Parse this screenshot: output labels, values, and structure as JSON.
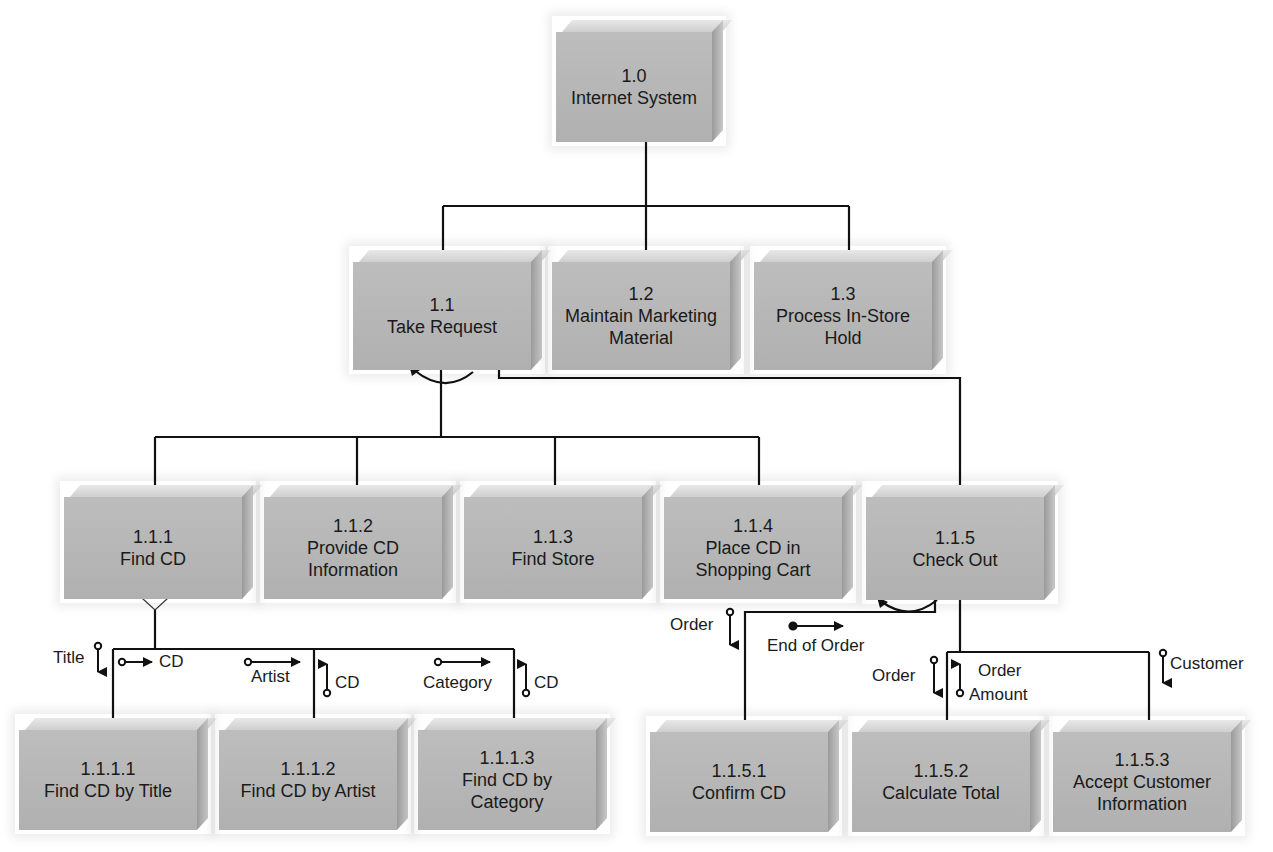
{
  "diagram": {
    "type": "structure-chart",
    "nodes": [
      {
        "id": "1.0",
        "number": "1.0",
        "lines": [
          "Internet System"
        ]
      },
      {
        "id": "1.1",
        "number": "1.1",
        "lines": [
          "Take Request"
        ]
      },
      {
        "id": "1.2",
        "number": "1.2",
        "lines": [
          "Maintain Marketing",
          "Material"
        ]
      },
      {
        "id": "1.3",
        "number": "1.3",
        "lines": [
          "Process In-Store",
          "Hold"
        ]
      },
      {
        "id": "1.1.1",
        "number": "1.1.1",
        "lines": [
          "Find CD"
        ]
      },
      {
        "id": "1.1.2",
        "number": "1.1.2",
        "lines": [
          "Provide CD",
          "Information"
        ]
      },
      {
        "id": "1.1.3",
        "number": "1.1.3",
        "lines": [
          "Find Store"
        ]
      },
      {
        "id": "1.1.4",
        "number": "1.1.4",
        "lines": [
          "Place CD in",
          "Shopping Cart"
        ]
      },
      {
        "id": "1.1.5",
        "number": "1.1.5",
        "lines": [
          "Check Out"
        ]
      },
      {
        "id": "1.1.1.1",
        "number": "1.1.1.1",
        "lines": [
          "Find CD by Title"
        ]
      },
      {
        "id": "1.1.1.2",
        "number": "1.1.1.2",
        "lines": [
          "Find CD by Artist"
        ]
      },
      {
        "id": "1.1.1.3",
        "number": "1.1.1.3",
        "lines": [
          "Find CD by",
          "Category"
        ]
      },
      {
        "id": "1.1.5.1",
        "number": "1.1.5.1",
        "lines": [
          "Confirm CD"
        ]
      },
      {
        "id": "1.1.5.2",
        "number": "1.1.5.2",
        "lines": [
          "Calculate Total"
        ]
      },
      {
        "id": "1.1.5.3",
        "number": "1.1.5.3",
        "lines": [
          "Accept Customer",
          "Information"
        ]
      }
    ],
    "edges": [
      {
        "from": "1.0",
        "to": "1.1"
      },
      {
        "from": "1.0",
        "to": "1.2"
      },
      {
        "from": "1.0",
        "to": "1.3"
      },
      {
        "from": "1.1",
        "to": "1.1.1"
      },
      {
        "from": "1.1",
        "to": "1.1.2"
      },
      {
        "from": "1.1",
        "to": "1.1.3"
      },
      {
        "from": "1.1",
        "to": "1.1.4"
      },
      {
        "from": "1.1",
        "to": "1.1.5"
      },
      {
        "from": "1.1.1",
        "to": "1.1.1.1"
      },
      {
        "from": "1.1.1",
        "to": "1.1.1.2"
      },
      {
        "from": "1.1.1",
        "to": "1.1.1.3"
      },
      {
        "from": "1.1.5",
        "to": "1.1.5.1"
      },
      {
        "from": "1.1.5",
        "to": "1.1.5.2"
      },
      {
        "from": "1.1.5",
        "to": "1.1.5.3"
      }
    ],
    "symbols": {
      "selection": [
        "1.0",
        "1.1.1"
      ],
      "iteration": [
        "1.1",
        "1.1.5"
      ]
    },
    "couples": {
      "title_down": "Title",
      "cd_title": "CD",
      "artist": "Artist",
      "cd_artist": "CD",
      "category": "Category",
      "cd_category": "CD",
      "order_confirm": "Order",
      "end_of_order": "End of Order",
      "order_calc": "Order",
      "order_amount_1": "Order",
      "order_amount_2": "Amount",
      "customer": "Customer"
    },
    "colors": {
      "box_face": "#b3b3b3",
      "box_top": "#dcdcdc",
      "box_side": "#a0a0a0",
      "line": "#111111",
      "background": "#ffffff"
    }
  },
  "n": {
    "a": {
      "num": "1.0",
      "l1": "Internet System",
      "l2": ""
    },
    "b": {
      "num": "1.1",
      "l1": "Take Request",
      "l2": ""
    },
    "c": {
      "num": "1.2",
      "l1": "Maintain Marketing",
      "l2": "Material"
    },
    "d": {
      "num": "1.3",
      "l1": "Process In-Store",
      "l2": "Hold"
    },
    "e": {
      "num": "1.1.1",
      "l1": "Find CD",
      "l2": ""
    },
    "f": {
      "num": "1.1.2",
      "l1": "Provide CD",
      "l2": "Information"
    },
    "g": {
      "num": "1.1.3",
      "l1": "Find Store",
      "l2": ""
    },
    "h": {
      "num": "1.1.4",
      "l1": "Place CD in",
      "l2": "Shopping Cart"
    },
    "i": {
      "num": "1.1.5",
      "l1": "Check Out",
      "l2": ""
    },
    "j": {
      "num": "1.1.1.1",
      "l1": "Find CD by Title",
      "l2": ""
    },
    "k": {
      "num": "1.1.1.2",
      "l1": "Find CD by Artist",
      "l2": ""
    },
    "l": {
      "num": "1.1.1.3",
      "l1": "Find CD by",
      "l2": "Category"
    },
    "m": {
      "num": "1.1.5.1",
      "l1": "Confirm CD",
      "l2": ""
    },
    "o": {
      "num": "1.1.5.2",
      "l1": "Calculate Total",
      "l2": ""
    },
    "p": {
      "num": "1.1.5.3",
      "l1": "Accept Customer",
      "l2": "Information"
    }
  }
}
